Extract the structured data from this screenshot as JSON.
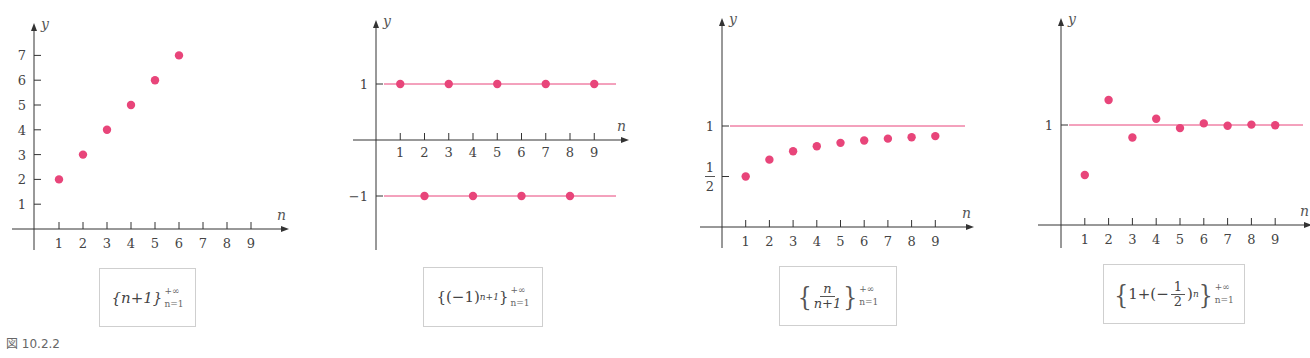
{
  "figure_caption": "図 10.2.2",
  "colors": {
    "point": "#e8457a",
    "line": "#e8457a",
    "axis": "#333333"
  },
  "axis_labels": {
    "x": "n",
    "y": "y"
  },
  "formulas": [
    {
      "id": "a",
      "main": "{n+1}",
      "upper": "+∞",
      "lower": "n=1"
    },
    {
      "id": "b",
      "main": "{(−1)",
      "exponent": "n+1",
      "close": "}",
      "upper": "+∞",
      "lower": "n=1"
    },
    {
      "id": "c",
      "numerator": "n",
      "denominator": "n+1",
      "upper": "+∞",
      "lower": "n=1"
    },
    {
      "id": "d",
      "prefix": "1+(−",
      "numerator": "1",
      "denominator": "2",
      "exponent": "n",
      "upper": "+∞",
      "lower": "n=1"
    }
  ],
  "chart_data": [
    {
      "type": "scatter",
      "title": "{n+1} n=1..+∞",
      "xlabel": "n",
      "ylabel": "y",
      "x_ticks": [
        1,
        2,
        3,
        4,
        5,
        6,
        7,
        8,
        9
      ],
      "y_ticks": [
        1,
        2,
        3,
        4,
        5,
        6,
        7
      ],
      "x": [
        1,
        2,
        3,
        4,
        5,
        6
      ],
      "y": [
        2,
        3,
        4,
        5,
        6,
        7
      ],
      "reference_lines": [],
      "grid": false
    },
    {
      "type": "scatter",
      "title": "{(-1)^(n+1)} n=1..+∞",
      "xlabel": "n",
      "ylabel": "y",
      "x_ticks": [
        1,
        2,
        3,
        4,
        5,
        6,
        7,
        8,
        9
      ],
      "y_ticks": [
        "1",
        "−1"
      ],
      "x": [
        1,
        2,
        3,
        4,
        5,
        6,
        7,
        8,
        9
      ],
      "y": [
        1,
        -1,
        1,
        -1,
        1,
        -1,
        1,
        -1,
        1
      ],
      "reference_lines": [
        1,
        -1
      ],
      "grid": false
    },
    {
      "type": "scatter",
      "title": "{n/(n+1)} n=1..+∞",
      "xlabel": "n",
      "ylabel": "y",
      "x_ticks": [
        1,
        2,
        3,
        4,
        5,
        6,
        7,
        8,
        9
      ],
      "y_ticks": [
        "1/2",
        "1"
      ],
      "x": [
        1,
        2,
        3,
        4,
        5,
        6,
        7,
        8,
        9
      ],
      "y": [
        0.5,
        0.667,
        0.75,
        0.8,
        0.833,
        0.857,
        0.875,
        0.889,
        0.9
      ],
      "reference_lines": [
        1
      ],
      "grid": false
    },
    {
      "type": "scatter",
      "title": "{1+(-1/2)^n} n=1..+∞",
      "xlabel": "n",
      "ylabel": "y",
      "x_ticks": [
        1,
        2,
        3,
        4,
        5,
        6,
        7,
        8,
        9
      ],
      "y_ticks": [
        "1"
      ],
      "x": [
        1,
        2,
        3,
        4,
        5,
        6,
        7,
        8,
        9
      ],
      "y": [
        0.5,
        1.25,
        0.875,
        1.0625,
        0.969,
        1.016,
        0.992,
        1.004,
        0.998
      ],
      "reference_lines": [
        1
      ],
      "grid": false
    }
  ]
}
